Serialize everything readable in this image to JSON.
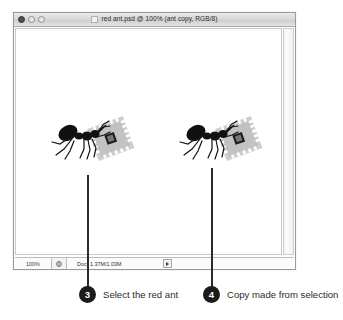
{
  "window": {
    "title": "red ant.psd @ 100% (ant copy, RGB/8)",
    "controls": {
      "close_label": "",
      "minimize_label": "",
      "zoom_label": ""
    }
  },
  "statusbar": {
    "zoom_level": "100%",
    "doc_label": "Doc:",
    "doc_size": "1.37M/1.03M"
  },
  "canvas": {
    "objects": [
      {
        "name": "red ant original",
        "label": ""
      },
      {
        "name": "red ant copy",
        "label": ""
      }
    ]
  },
  "callouts": [
    {
      "number": "3",
      "text": "Select the red ant"
    },
    {
      "number": "4",
      "text": "Copy made from selection"
    }
  ],
  "colors": {
    "badge_fill": "#1b1b1b",
    "badge_text": "#ffffff",
    "leader_line": "#2b2b2b",
    "ant_body": "#111111",
    "chip_body": "#c9c9c9"
  }
}
